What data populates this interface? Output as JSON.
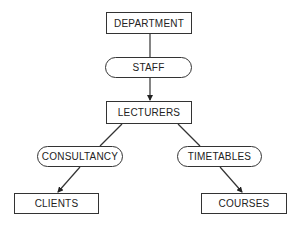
{
  "diagram": {
    "type": "hierarchy",
    "nodes": {
      "department": {
        "label": "DEPARTMENT",
        "shape": "rectangle"
      },
      "staff": {
        "label": "STAFF",
        "shape": "rounded"
      },
      "lecturers": {
        "label": "LECTURERS",
        "shape": "rectangle"
      },
      "consultancy": {
        "label": "CONSULTANCY",
        "shape": "rounded"
      },
      "timetables": {
        "label": "TIMETABLES",
        "shape": "rounded"
      },
      "clients": {
        "label": "CLIENTS",
        "shape": "rectangle"
      },
      "courses": {
        "label": "COURSES",
        "shape": "rectangle"
      }
    },
    "edges": [
      {
        "from": "DEPARTMENT",
        "to": "STAFF",
        "arrow": false
      },
      {
        "from": "STAFF",
        "to": "LECTURERS",
        "arrow": true
      },
      {
        "from": "LECTURERS",
        "to": "CONSULTANCY",
        "arrow": false
      },
      {
        "from": "LECTURERS",
        "to": "TIMETABLES",
        "arrow": false
      },
      {
        "from": "CONSULTANCY",
        "to": "CLIENTS",
        "arrow": true
      },
      {
        "from": "TIMETABLES",
        "to": "COURSES",
        "arrow": true
      }
    ],
    "colors": {
      "stroke": "#333333",
      "background": "#ffffff",
      "text": "#222222"
    }
  }
}
